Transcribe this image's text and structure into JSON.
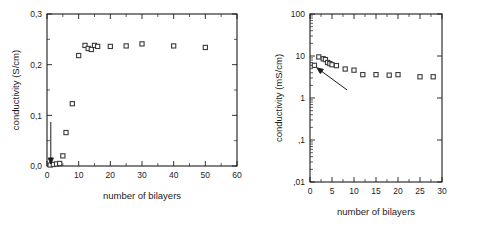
{
  "chart_data": [
    {
      "id": "left",
      "type": "scatter",
      "title": "",
      "xlabel": "number of bilayers",
      "ylabel": "conductivity (S/cm)",
      "xlim": [
        0,
        60
      ],
      "ylim": [
        0.0,
        0.3
      ],
      "xticks": [
        0,
        10,
        20,
        30,
        40,
        50,
        60
      ],
      "xtick_labels": [
        "0",
        "10",
        "20",
        "30",
        "40",
        "50",
        "60"
      ],
      "yticks": [
        0.0,
        0.1,
        0.2,
        0.3
      ],
      "ytick_labels": [
        "0,0",
        "0,1",
        "0,2",
        "0,3"
      ],
      "y_minor_ticks": [
        0.05,
        0.15,
        0.25
      ],
      "grid": false,
      "legend": "none",
      "marker": "open-square",
      "series": [
        {
          "name": "conductivity",
          "x": [
            1,
            2,
            3,
            4,
            5,
            6,
            8,
            10,
            12,
            13,
            14,
            15,
            16,
            20,
            25,
            30,
            40,
            50
          ],
          "y": [
            0.002,
            0.003,
            0.004,
            0.005,
            0.02,
            0.066,
            0.123,
            0.218,
            0.238,
            0.232,
            0.23,
            0.238,
            0.236,
            0.236,
            0.237,
            0.241,
            0.237,
            0.234
          ]
        }
      ],
      "annotations": [
        {
          "kind": "arrow",
          "label": "",
          "points_to_x": 1.2,
          "points_to_y": 0.004,
          "direction": "down"
        }
      ]
    },
    {
      "id": "right",
      "type": "scatter",
      "title": "",
      "xlabel": "number of bilayers",
      "ylabel": "conductivity (mS/cm)",
      "xlim": [
        0,
        30
      ],
      "ylim": [
        0.01,
        100
      ],
      "yscale": "log",
      "xticks": [
        0,
        5,
        10,
        15,
        20,
        25,
        30
      ],
      "xtick_labels": [
        "0",
        "5",
        "10",
        "15",
        "20",
        "25",
        "30"
      ],
      "yticks": [
        0.01,
        0.1,
        1,
        10,
        100
      ],
      "ytick_labels": [
        ",01",
        ",1",
        "1",
        "10",
        "100"
      ],
      "grid": false,
      "legend": "none",
      "marker": "open-square",
      "series": [
        {
          "name": "conductivity",
          "x": [
            1,
            2,
            3,
            3.5,
            4,
            4.5,
            5,
            6,
            8,
            10,
            12,
            15,
            18,
            20,
            25,
            28
          ],
          "y": [
            6.0,
            9.5,
            8.6,
            8.2,
            7.0,
            6.6,
            6.2,
            5.9,
            4.9,
            4.6,
            3.6,
            3.6,
            3.5,
            3.6,
            3.2,
            3.2
          ]
        }
      ],
      "annotations": [
        {
          "kind": "arrow",
          "label": "",
          "points_to_x": 1.6,
          "points_to_y": 5.2,
          "direction": "up-left"
        }
      ]
    }
  ]
}
